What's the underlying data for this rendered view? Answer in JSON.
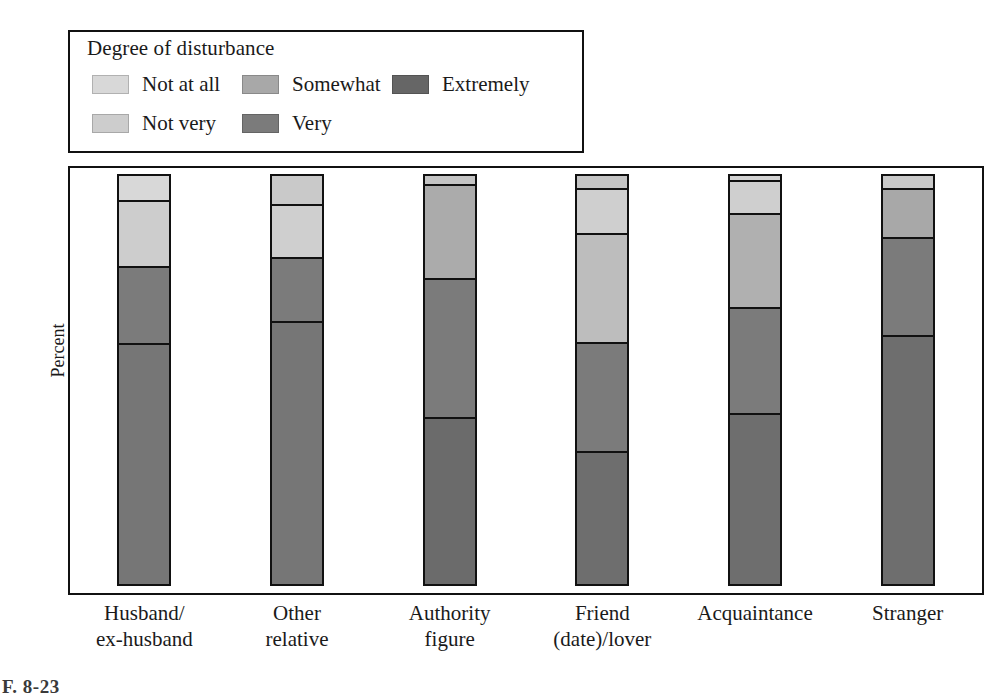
{
  "legend": {
    "title": "Degree of disturbance",
    "items": [
      {
        "label": "Not at all",
        "key": "not_at_all",
        "color": "#d8d8d8"
      },
      {
        "label": "Not very",
        "key": "not_very",
        "color": "#cdcdcd"
      },
      {
        "label": "Somewhat",
        "key": "somewhat",
        "color": "#a8a8a8"
      },
      {
        "label": "Very",
        "key": "very",
        "color": "#7b7b7b"
      },
      {
        "label": "Extremely",
        "key": "extremely",
        "color": "#666666"
      }
    ]
  },
  "axes": {
    "ylabel": "Percent",
    "xlabel": ""
  },
  "caption": "F. 8-23",
  "chart_data": {
    "type": "bar",
    "subtype": "stacked-100-percent",
    "orientation": "vertical",
    "title": "",
    "subtitle": "",
    "xlabel": "",
    "ylabel": "Percent",
    "ylim": [
      0,
      100
    ],
    "grid": false,
    "legend_title": "Degree of disturbance",
    "legend_position": "above-plot",
    "stack_order_top_to_bottom": [
      "Not at all",
      "Not very",
      "Somewhat",
      "Very",
      "Extremely"
    ],
    "categories": [
      "Husband/ex-husband",
      "Other relative",
      "Authority figure",
      "Friend (date)/lover",
      "Acquaintance",
      "Stranger"
    ],
    "category_lines": [
      [
        "Husband/",
        "ex-husband"
      ],
      [
        "Other",
        "relative"
      ],
      [
        "Authority",
        "figure"
      ],
      [
        "Friend",
        "(date)/lover"
      ],
      [
        "Acquaintance",
        ""
      ],
      [
        "Stranger",
        ""
      ]
    ],
    "series": [
      {
        "name": "Not at all",
        "color": "#d8d8d8",
        "values": [
          6,
          7,
          2,
          3,
          1,
          3
        ]
      },
      {
        "name": "Not very",
        "color": "#cdcdcd",
        "values": [
          null,
          null,
          null,
          11,
          8,
          null
        ]
      },
      {
        "name": "Somewhat",
        "color": "#a8a8a8",
        "values": [
          16,
          13,
          23,
          27,
          23,
          12
        ]
      },
      {
        "name": "Very",
        "color": "#7b7b7b",
        "values": [
          19,
          16,
          34,
          27,
          26,
          24
        ]
      },
      {
        "name": "Extremely",
        "color": "#666666",
        "values": [
          59,
          65,
          41,
          33,
          42,
          61
        ]
      }
    ],
    "bars": [
      {
        "category": "Husband/ex-husband",
        "segments": [
          {
            "series": "Not at all",
            "value": 6,
            "label": "6",
            "color": "#d8d8d8"
          },
          {
            "series": "Somewhat",
            "value": 16,
            "label": "16",
            "color": "#cdcdcd"
          },
          {
            "series": "Very",
            "value": 19,
            "label": "19",
            "color": "#7b7b7b"
          },
          {
            "series": "Extremely",
            "value": 59,
            "label": "59",
            "color": "#767676"
          }
        ],
        "total": 100
      },
      {
        "category": "Other relative",
        "segments": [
          {
            "series": "Not at all",
            "value": 7,
            "label": "7",
            "color": "#c9c9c9"
          },
          {
            "series": "Somewhat",
            "value": 13,
            "label": "13",
            "color": "#cfcfcf"
          },
          {
            "series": "Very",
            "value": 16,
            "label": "16",
            "color": "#7b7b7b"
          },
          {
            "series": "Extremely",
            "value": 65,
            "label": "65",
            "color": "#767676"
          }
        ],
        "total": 101
      },
      {
        "category": "Authority figure",
        "segments": [
          {
            "series": "Not at all",
            "value": 2,
            "label": "2",
            "color": "#c4c4c4"
          },
          {
            "series": "Somewhat",
            "value": 23,
            "label": "23",
            "color": "#ababab"
          },
          {
            "series": "Very",
            "value": 34,
            "label": "34",
            "color": "#7b7b7b"
          },
          {
            "series": "Extremely",
            "value": 41,
            "label": "41",
            "color": "#6b6b6b"
          }
        ],
        "total": 100
      },
      {
        "category": "Friend (date)/lover",
        "segments": [
          {
            "series": "Not at all",
            "value": 3,
            "label": "3",
            "color": "#c4c4c4"
          },
          {
            "series": "Not very",
            "value": 11,
            "label": "11",
            "color": "#cfcfcf"
          },
          {
            "series": "Somewhat",
            "value": 27,
            "label": "27",
            "color": "#bdbdbd"
          },
          {
            "series": "Very",
            "value": 27,
            "label": "27",
            "color": "#7b7b7b"
          },
          {
            "series": "Extremely",
            "value": 33,
            "label": "33",
            "color": "#6e6e6e"
          }
        ],
        "total": 101
      },
      {
        "category": "Acquaintance",
        "segments": [
          {
            "series": "Not at all",
            "value": 1,
            "label": "1",
            "color": "#d2d2d2"
          },
          {
            "series": "Not very",
            "value": 8,
            "label": "8",
            "color": "#cfcfcf"
          },
          {
            "series": "Somewhat",
            "value": 23,
            "label": "23",
            "color": "#b0b0b0"
          },
          {
            "series": "Very",
            "value": 26,
            "label": "26",
            "color": "#7b7b7b"
          },
          {
            "series": "Extremely",
            "value": 42,
            "label": "42",
            "color": "#6e6e6e"
          }
        ],
        "total": 100
      },
      {
        "category": "Stranger",
        "segments": [
          {
            "series": "Not at all",
            "value": 3,
            "label": "3",
            "color": "#c9c9c9"
          },
          {
            "series": "Somewhat",
            "value": 12,
            "label": "12",
            "color": "#a8a8a8"
          },
          {
            "series": "Very",
            "value": 24,
            "label": "24",
            "color": "#7b7b7b"
          },
          {
            "series": "Extremely",
            "value": 61,
            "label": "61",
            "color": "#6e6e6e"
          }
        ],
        "total": 100
      }
    ]
  }
}
